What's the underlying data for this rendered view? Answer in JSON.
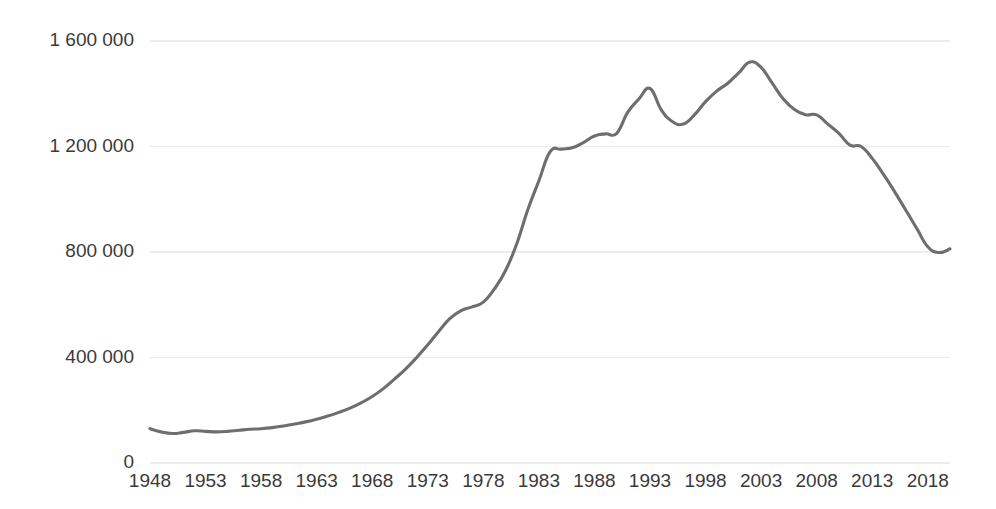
{
  "chart_data": {
    "type": "line",
    "title": "",
    "subtitle": "",
    "xlabel": "",
    "ylabel": "",
    "xlim": [
      1948,
      2020
    ],
    "ylim": [
      0,
      1600000
    ],
    "grid": true,
    "grid_axis": "y",
    "legend": false,
    "legend_position": "none",
    "line_color": "#6e6e6e",
    "gridline_color": "#ececec",
    "tick_label_color": "#3a3a3a",
    "background_color": "#ffffff",
    "y_ticks": [
      0,
      400000,
      800000,
      1200000,
      1600000
    ],
    "y_tick_labels": [
      "0",
      "400 000",
      "800 000",
      "1 200 000",
      "1 600 000"
    ],
    "x_ticks": [
      1948,
      1953,
      1958,
      1963,
      1968,
      1973,
      1978,
      1983,
      1988,
      1993,
      1998,
      2003,
      2008,
      2013,
      2018
    ],
    "x_tick_labels": [
      "1948",
      "1953",
      "1958",
      "1963",
      "1968",
      "1973",
      "1978",
      "1983",
      "1988",
      "1993",
      "1998",
      "2003",
      "2008",
      "2013",
      "2018"
    ],
    "series": [
      {
        "name": "",
        "color": "#6e6e6e",
        "x": [
          1948,
          1949,
          1950,
          1951,
          1952,
          1953,
          1954,
          1955,
          1956,
          1957,
          1958,
          1959,
          1960,
          1961,
          1962,
          1963,
          1964,
          1965,
          1966,
          1967,
          1968,
          1969,
          1970,
          1971,
          1972,
          1973,
          1974,
          1975,
          1976,
          1977,
          1978,
          1979,
          1980,
          1981,
          1982,
          1983,
          1984,
          1985,
          1986,
          1987,
          1988,
          1989,
          1990,
          1991,
          1992,
          1993,
          1994,
          1995,
          1996,
          1997,
          1998,
          1999,
          2000,
          2001,
          2002,
          2003,
          2004,
          2005,
          2006,
          2007,
          2008,
          2009,
          2010,
          2011,
          2012,
          2013,
          2014,
          2015,
          2016,
          2017,
          2018,
          2019,
          2020
        ],
        "values": [
          130000,
          118000,
          112000,
          116000,
          122000,
          120000,
          118000,
          120000,
          124000,
          128000,
          130000,
          134000,
          140000,
          148000,
          156000,
          166000,
          178000,
          192000,
          208000,
          228000,
          252000,
          282000,
          318000,
          356000,
          400000,
          448000,
          500000,
          548000,
          578000,
          592000,
          610000,
          660000,
          730000,
          830000,
          960000,
          1070000,
          1180000,
          1190000,
          1195000,
          1215000,
          1240000,
          1248000,
          1250000,
          1330000,
          1380000,
          1420000,
          1340000,
          1295000,
          1285000,
          1320000,
          1370000,
          1410000,
          1440000,
          1480000,
          1520000,
          1500000,
          1440000,
          1380000,
          1340000,
          1320000,
          1320000,
          1285000,
          1250000,
          1205000,
          1200000,
          1155000,
          1095000,
          1030000,
          960000,
          890000,
          820000,
          798000,
          812000
        ]
      }
    ]
  },
  "plot_geometry": {
    "left": 150,
    "right": 950,
    "top": 41,
    "bottom": 463
  }
}
